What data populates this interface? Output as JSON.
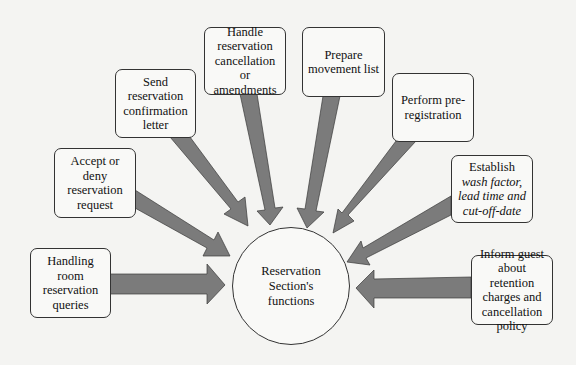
{
  "diagram": {
    "center": {
      "label": "Reservation Section's functions"
    },
    "nodes": [
      {
        "id": "handling-queries",
        "label": "Handling room reservation queries"
      },
      {
        "id": "accept-deny",
        "label": "Accept or deny reservation request"
      },
      {
        "id": "send-confirmation",
        "label": "Send reservation confirmation letter"
      },
      {
        "id": "handle-cancellation",
        "label": "Handle reservation cancellation or amendments"
      },
      {
        "id": "prepare-movement",
        "label": "Prepare movement list"
      },
      {
        "id": "pre-registration",
        "label": "Perform pre-registration"
      },
      {
        "id": "establish-wash",
        "label_prefix": "Establish ",
        "label_italic": "wash factor, lead time and cut-off-date"
      },
      {
        "id": "inform-guest",
        "label": "Inform guest about retention charges and cancellation policy"
      }
    ],
    "edges_direction": "all nodes point to center",
    "colors": {
      "arrow_fill": "#7a7a7a",
      "arrow_stroke": "#3a3a3a",
      "background": "#f4f4f2",
      "box_border": "#333333"
    }
  }
}
